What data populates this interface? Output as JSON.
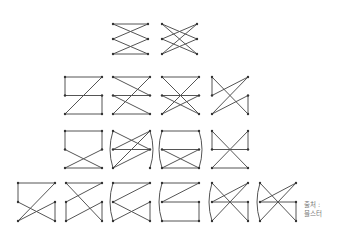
{
  "caption": {
    "line1": "출처 :",
    "line2": "블스터"
  },
  "style": {
    "stroke": "#555555",
    "dot": "#333333"
  },
  "figures": [
    {
      "x": 113,
      "y": 24,
      "w": 35,
      "h": 30,
      "edges": [
        [
          "TL",
          "TR"
        ],
        [
          "TL",
          "MR"
        ],
        [
          "TR",
          "ML"
        ],
        [
          "ML",
          "BR"
        ],
        [
          "MR",
          "BL"
        ],
        [
          "BL",
          "BR"
        ]
      ],
      "arcs": []
    },
    {
      "x": 162,
      "y": 24,
      "w": 35,
      "h": 30,
      "edges": [
        [
          "TL",
          "MR"
        ],
        [
          "TL",
          "BR"
        ],
        [
          "TR",
          "ML"
        ],
        [
          "TR",
          "BL"
        ],
        [
          "ML",
          "BR"
        ],
        [
          "MR",
          "BL"
        ]
      ],
      "arcs": []
    },
    {
      "x": 65,
      "y": 77,
      "w": 37,
      "h": 37,
      "edges": [
        [
          "TL",
          "TR"
        ],
        [
          "TL",
          "ML"
        ],
        [
          "ML",
          "MR"
        ],
        [
          "MR",
          "BR"
        ],
        [
          "TR",
          "BL"
        ],
        [
          "BL",
          "BR"
        ]
      ],
      "arcs": []
    },
    {
      "x": 113,
      "y": 77,
      "w": 37,
      "h": 37,
      "edges": [
        [
          "TL",
          "TR"
        ],
        [
          "TL",
          "MR"
        ],
        [
          "ML",
          "MR"
        ],
        [
          "TR",
          "BL"
        ],
        [
          "ML",
          "BR"
        ],
        [
          "BL",
          "BR"
        ]
      ],
      "arcs": []
    },
    {
      "x": 162,
      "y": 77,
      "w": 37,
      "h": 37,
      "edges": [
        [
          "TL",
          "TR"
        ],
        [
          "TL",
          "BR"
        ],
        [
          "TR",
          "BL"
        ],
        [
          "ML",
          "MR"
        ],
        [
          "ML",
          "BR"
        ],
        [
          "MR",
          "BL"
        ]
      ],
      "arcs": []
    },
    {
      "x": 212,
      "y": 77,
      "w": 36,
      "h": 37,
      "edges": [
        [
          "TL",
          "ML"
        ],
        [
          "TL",
          "BR"
        ],
        [
          "ML",
          "TR"
        ],
        [
          "BL",
          "MR"
        ],
        [
          "MR",
          "BR"
        ],
        [
          "BL",
          "TR"
        ]
      ],
      "arcs": []
    },
    {
      "x": 65,
      "y": 131,
      "w": 37,
      "h": 37,
      "edges": [
        [
          "TL",
          "TR"
        ],
        [
          "TL",
          "ML"
        ],
        [
          "TR",
          "MR"
        ],
        [
          "ML",
          "BR"
        ],
        [
          "MR",
          "BL"
        ],
        [
          "BL",
          "BR"
        ]
      ],
      "arcs": []
    },
    {
      "x": 113,
      "y": 131,
      "w": 37,
      "h": 37,
      "edges": [
        [
          "TL",
          "MR"
        ],
        [
          "TR",
          "BL"
        ],
        [
          "ML",
          "MR"
        ],
        [
          "TR",
          "TR"
        ]
      ],
      "arcs": [
        [
          "TL",
          "BL"
        ],
        [
          "TR",
          "BR"
        ]
      ],
      "extra": [
        [
          "TR",
          "ML"
        ],
        [
          "ML",
          "MR"
        ],
        [
          "MR",
          "BL"
        ]
      ]
    },
    {
      "x": 162,
      "y": 131,
      "w": 37,
      "h": 37,
      "edges": [
        [
          "TL",
          "TR"
        ],
        [
          "ML",
          "MR"
        ],
        [
          "ML",
          "BR"
        ],
        [
          "MR",
          "BL"
        ],
        [
          "BL",
          "BR"
        ]
      ],
      "arcs": [
        [
          "TL",
          "BL"
        ],
        [
          "TR",
          "BR"
        ]
      ]
    },
    {
      "x": 212,
      "y": 131,
      "w": 36,
      "h": 37,
      "edges": [
        [
          "TL",
          "ML"
        ],
        [
          "TL",
          "BR"
        ],
        [
          "TR",
          "MR"
        ],
        [
          "TR",
          "BL"
        ],
        [
          "ML",
          "MR"
        ],
        [
          "BL",
          "BR"
        ]
      ],
      "arcs": []
    },
    {
      "x": 18,
      "y": 183,
      "w": 37,
      "h": 38,
      "edges": [
        [
          "TL",
          "TR"
        ],
        [
          "TL",
          "ML"
        ],
        [
          "TR",
          "BL"
        ],
        [
          "ML",
          "BR"
        ],
        [
          "BL",
          "MR"
        ],
        [
          "MR",
          "BR"
        ]
      ],
      "arcs": []
    },
    {
      "x": 66,
      "y": 183,
      "w": 36,
      "h": 38,
      "edges": [
        [
          "TL",
          "TR"
        ],
        [
          "TL",
          "BR"
        ],
        [
          "TR",
          "ML"
        ],
        [
          "ML",
          "BL"
        ],
        [
          "BL",
          "MR"
        ],
        [
          "MR",
          "BR"
        ]
      ],
      "arcs": []
    },
    {
      "x": 113,
      "y": 183,
      "w": 37,
      "h": 38,
      "edges": [
        [
          "TL",
          "TR"
        ],
        [
          "TR",
          "ML"
        ],
        [
          "ML",
          "BR"
        ],
        [
          "BL",
          "MR"
        ],
        [
          "MR",
          "BR"
        ]
      ],
      "arcs": [
        [
          "TL",
          "BL"
        ]
      ]
    },
    {
      "x": 162,
      "y": 183,
      "w": 37,
      "h": 38,
      "edges": [
        [
          "TL",
          "TR"
        ],
        [
          "TR",
          "ML"
        ],
        [
          "ML",
          "MR"
        ],
        [
          "MR",
          "BR"
        ],
        [
          "BL",
          "BR"
        ]
      ],
      "arcs": [
        [
          "TL",
          "BL"
        ]
      ]
    },
    {
      "x": 212,
      "y": 183,
      "w": 36,
      "h": 38,
      "edges": [
        [
          "TL",
          "BR"
        ],
        [
          "TR",
          "ML"
        ],
        [
          "ML",
          "MR"
        ],
        [
          "TR",
          "BL"
        ],
        [
          "MR",
          "BR"
        ]
      ],
      "arcs": [
        [
          "TL",
          "BL"
        ]
      ]
    },
    {
      "x": 260,
      "y": 183,
      "w": 36,
      "h": 38,
      "edges": [
        [
          "TL",
          "BR"
        ],
        [
          "TR",
          "ML"
        ],
        [
          "ML",
          "MR"
        ],
        [
          "TR",
          "BL"
        ],
        [
          "MR",
          "BR"
        ]
      ],
      "arcs": [
        [
          "TL",
          "BL"
        ]
      ]
    }
  ]
}
